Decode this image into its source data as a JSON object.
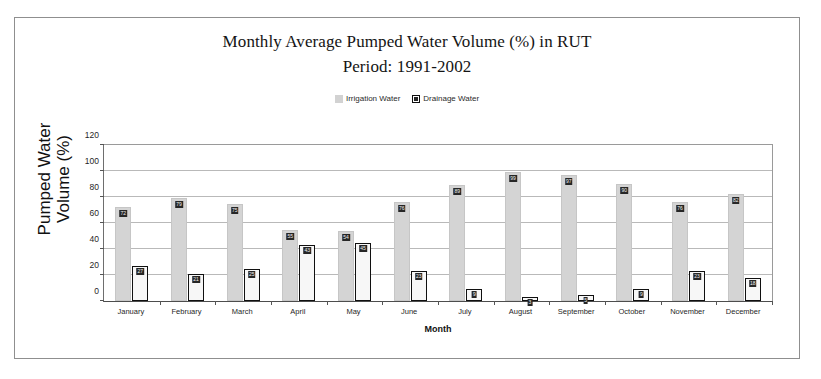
{
  "chart_data": {
    "type": "bar",
    "title": "Monthly Average Pumped Water Volume (%) in RUT",
    "subtitle": "Period: 1991-2002",
    "xlabel": "Month",
    "ylabel": "Pumped Water Volume (%)",
    "ylim": [
      0,
      120
    ],
    "yticks": [
      0,
      20,
      40,
      60,
      80,
      100,
      120
    ],
    "grid": true,
    "legend_position": "top-center",
    "categories": [
      "January",
      "February",
      "March",
      "April",
      "May",
      "June",
      "July",
      "August",
      "September",
      "October",
      "November",
      "December"
    ],
    "series": [
      {
        "name": "Irrigation Water",
        "color": "#d4d4d4",
        "values": [
          72,
          79,
          75,
          55,
          54,
          76,
          89,
          99,
          97,
          90,
          76,
          82
        ],
        "labels": [
          "72",
          "79",
          "75",
          "55",
          "54",
          "76",
          "89",
          "99",
          "97",
          "90",
          "76",
          "82"
        ]
      },
      {
        "name": "Drainage Water",
        "color": "#f7f7f7",
        "border_color": "#101010",
        "values": [
          27,
          21,
          25,
          43,
          45,
          23,
          9,
          3,
          5,
          9,
          23,
          18
        ],
        "labels": [
          "27",
          "21",
          "25",
          "43",
          "45",
          "23",
          "9",
          "3",
          "5",
          "9",
          "23",
          "18"
        ]
      }
    ]
  },
  "title_lines": [
    "Monthly Average Pumped Water Volume (%) in RUT",
    "Period: 1991-2002"
  ],
  "legend": {
    "items": [
      {
        "label": "Irrigation Water",
        "swatch": "gray-square-icon"
      },
      {
        "label": "Drainage Water",
        "swatch": "outlined-square-icon"
      }
    ]
  },
  "axes": {
    "y_title": "Pumped Water Volume (%)",
    "x_title": "Month"
  },
  "colors": {
    "irrigation_fill": "#d4d4d4",
    "drainage_fill": "#f7f7f7",
    "drainage_border": "#101010",
    "gridline": "#b9b9b9",
    "frame_border": "#8f8f8f"
  }
}
